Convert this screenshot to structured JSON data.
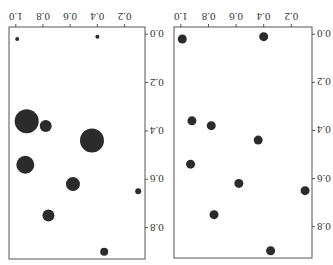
{
  "chart_data": [
    {
      "type": "scatter",
      "title": "",
      "xlabel": "",
      "ylabel": "",
      "variant": "bubble",
      "xlim": [
        0.05,
        1.05
      ],
      "ylim": [
        -0.03,
        0.93
      ],
      "xticks": [
        0.2,
        0.4,
        0.6,
        0.8,
        1.0
      ],
      "xtick_labels": [
        "0.2",
        "0.4",
        "0.6",
        "0.8",
        "1.0"
      ],
      "yticks": [
        0.0,
        0.2,
        0.4,
        0.6,
        0.8
      ],
      "ytick_labels": [
        "0.0",
        "0.2",
        "0.4",
        "0.6",
        "0.8"
      ],
      "grid": false,
      "color": "#2b2b2b",
      "points": [
        {
          "x": 0.99,
          "y": 0.02,
          "size": 2
        },
        {
          "x": 0.4,
          "y": 0.01,
          "size": 2
        },
        {
          "x": 0.92,
          "y": 0.36,
          "size": 12
        },
        {
          "x": 0.78,
          "y": 0.38,
          "size": 6
        },
        {
          "x": 0.44,
          "y": 0.44,
          "size": 12
        },
        {
          "x": 0.93,
          "y": 0.54,
          "size": 9
        },
        {
          "x": 0.58,
          "y": 0.62,
          "size": 7
        },
        {
          "x": 0.1,
          "y": 0.65,
          "size": 3
        },
        {
          "x": 0.76,
          "y": 0.75,
          "size": 6
        },
        {
          "x": 0.35,
          "y": 0.9,
          "size": 4
        }
      ]
    },
    {
      "type": "scatter",
      "title": "",
      "xlabel": "",
      "ylabel": "",
      "variant": "uniform",
      "xlim": [
        0.05,
        1.05
      ],
      "ylim": [
        -0.03,
        0.93
      ],
      "xticks": [
        0.2,
        0.4,
        0.6,
        0.8,
        1.0
      ],
      "xtick_labels": [
        "0.2",
        "0.4",
        "0.6",
        "0.8",
        "1.0"
      ],
      "yticks": [
        0.0,
        0.2,
        0.4,
        0.6,
        0.8
      ],
      "ytick_labels": [
        "0.0",
        "0.2",
        "0.4",
        "0.6",
        "0.8"
      ],
      "grid": false,
      "color": "#2b2b2b",
      "points": [
        {
          "x": 0.99,
          "y": 0.02,
          "size": 4.5
        },
        {
          "x": 0.4,
          "y": 0.01,
          "size": 4.5
        },
        {
          "x": 0.92,
          "y": 0.36,
          "size": 4.5
        },
        {
          "x": 0.78,
          "y": 0.38,
          "size": 4.5
        },
        {
          "x": 0.44,
          "y": 0.44,
          "size": 4.5
        },
        {
          "x": 0.93,
          "y": 0.54,
          "size": 4.5
        },
        {
          "x": 0.58,
          "y": 0.62,
          "size": 4.5
        },
        {
          "x": 0.1,
          "y": 0.65,
          "size": 4.5
        },
        {
          "x": 0.76,
          "y": 0.75,
          "size": 4.5
        },
        {
          "x": 0.35,
          "y": 0.9,
          "size": 4.5
        }
      ]
    }
  ],
  "display": {
    "rotation_deg": 180
  }
}
